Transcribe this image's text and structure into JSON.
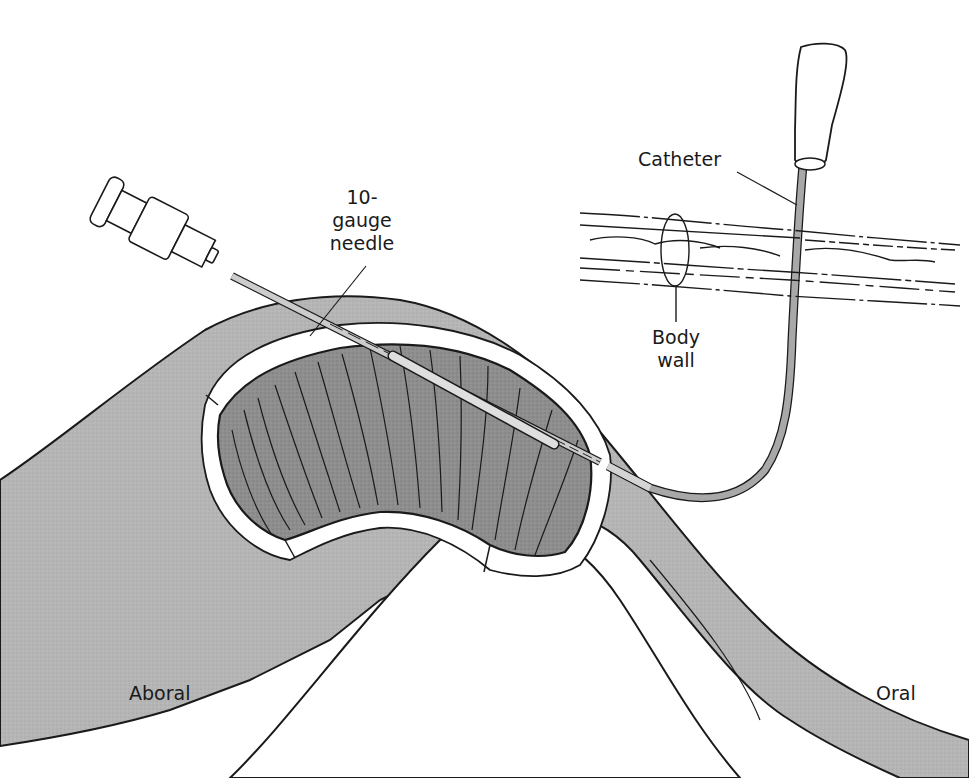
{
  "figure": {
    "colors": {
      "tissue_outer": "#b3b3b3",
      "tissue_lumen": "#8c8c8c",
      "cut_edge": "#ffffff",
      "needle": "#c8c8c8",
      "catheter": "#a6a6a6",
      "outline": "#1a1a1a"
    }
  },
  "labels": {
    "needle": {
      "line1": "10-",
      "line2": "gauge",
      "line3": "needle"
    },
    "catheter": "Catheter",
    "body_wall": {
      "line1": "Body",
      "line2": "wall"
    },
    "aboral": "Aboral",
    "oral": "Oral"
  }
}
